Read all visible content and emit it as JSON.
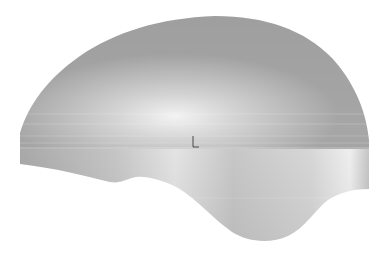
{
  "viewport": {
    "background": "#ffffff",
    "width": 389,
    "height": 261
  },
  "model": {
    "description": "3D shaded surface, dome-shaped top with wavy lower edge",
    "base_color": "#a8a8a8",
    "highlight_color": "#f2f2f2",
    "shadow_color": "#8f8f8f",
    "band_y": 148
  },
  "triad": {
    "icon": "coordinate-axis-triad-icon",
    "x": 193,
    "y": 143
  }
}
